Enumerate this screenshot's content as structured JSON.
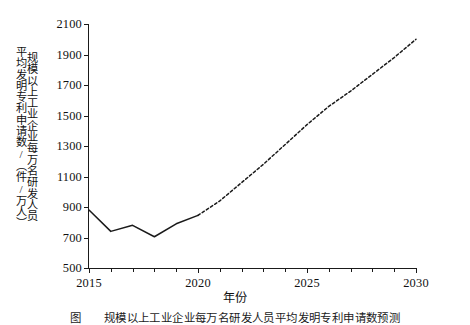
{
  "chart_data": {
    "type": "line",
    "title": "",
    "xlabel": "年份",
    "ylabel": "规模以上工业企业每万名研发人员平均发明专利申请数/（件/万人）",
    "ylabel_col1": "规模以上工业企业每万名研发人员",
    "ylabel_col2": "平均发明专利申请数/（件/万人）",
    "xlim": [
      2015,
      2030
    ],
    "ylim": [
      500,
      2100
    ],
    "grid": false,
    "legend": null,
    "xticks": [
      2015,
      2020,
      2025,
      2030
    ],
    "xtick_labels": [
      "2015",
      "2020",
      "2025",
      "2030"
    ],
    "xminor_ticks": [
      2016,
      2017,
      2018,
      2019,
      2021,
      2022,
      2023,
      2024,
      2026,
      2027,
      2028,
      2029
    ],
    "yticks": [
      500,
      700,
      900,
      1100,
      1300,
      1500,
      1700,
      1900,
      2100
    ],
    "ytick_labels": [
      "500",
      "700",
      "900",
      "1100",
      "1300",
      "1500",
      "1700",
      "1900",
      "2100"
    ],
    "line_color": "#1a1a1a",
    "series": [
      {
        "name": "历史值",
        "style": "solid",
        "x": [
          2015,
          2016,
          2017,
          2018,
          2019,
          2020
        ],
        "values": [
          880,
          740,
          780,
          705,
          790,
          845
        ]
      },
      {
        "name": "预测值",
        "style": "dashed",
        "x": [
          2020,
          2021,
          2022,
          2023,
          2024,
          2025,
          2026,
          2027,
          2028,
          2029,
          2030
        ],
        "values": [
          845,
          940,
          1060,
          1180,
          1310,
          1440,
          1560,
          1660,
          1770,
          1880,
          2000
        ]
      }
    ]
  },
  "figure": {
    "caption": "图　　规模以上工业企业每万名研发人员平均发明专利申请数预测"
  }
}
